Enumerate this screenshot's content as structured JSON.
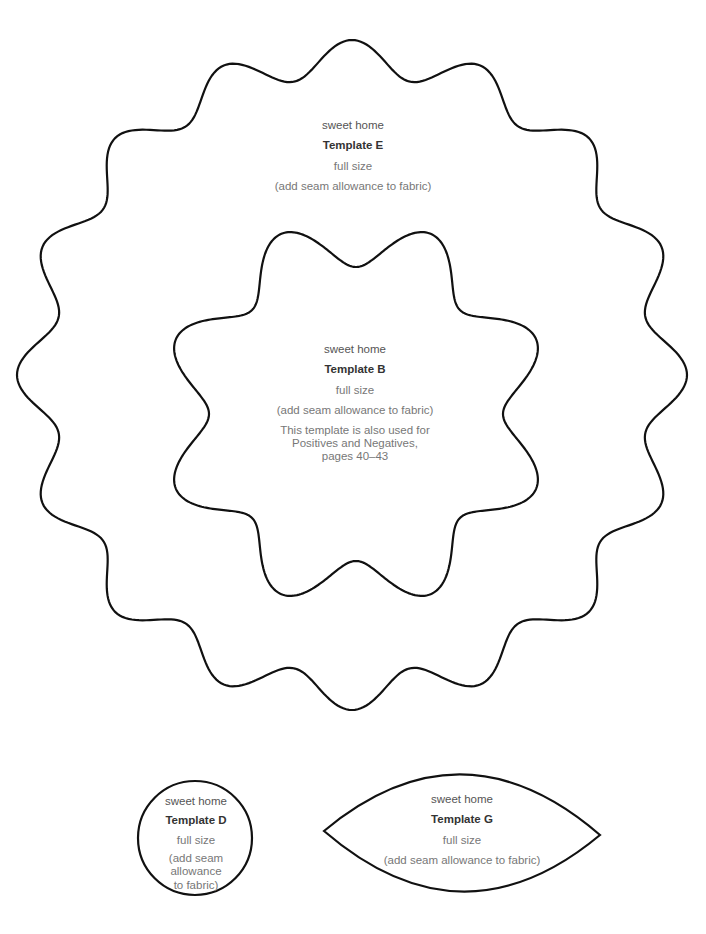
{
  "page": {
    "background": "#ffffff",
    "stroke_color": "#111111"
  },
  "templates": {
    "E": {
      "shape": "wavy-ring-16-lobes",
      "brand": "sweet home",
      "title": "Template E",
      "size": "full size",
      "seam": "(add seam allowance to fabric)"
    },
    "B": {
      "shape": "wavy-flower-8-lobes",
      "brand": "sweet home",
      "title": "Template B",
      "size": "full size",
      "seam": "(add seam allowance to fabric)",
      "note_line1": "This template is also used for",
      "note_line2": "Positives and Negatives,",
      "note_line3": "pages 40–43"
    },
    "D": {
      "shape": "circle",
      "brand": "sweet home",
      "title": "Template D",
      "size": "full size",
      "seam_line1": "(add seam",
      "seam_line2": "allowance",
      "seam_line3": "to fabric)"
    },
    "G": {
      "shape": "lens",
      "brand": "sweet home",
      "title": "Template G",
      "size": "full size",
      "seam": "(add seam allowance to fabric)"
    }
  }
}
